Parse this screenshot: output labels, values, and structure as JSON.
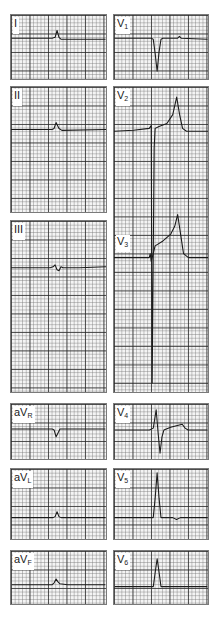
{
  "figure": {
    "type": "12-lead ECG",
    "layout": "two columns of lead panels on grid paper"
  },
  "leads": {
    "I": {
      "name": "I",
      "sub": ""
    },
    "II": {
      "name": "II",
      "sub": ""
    },
    "III": {
      "name": "III",
      "sub": ""
    },
    "aVR": {
      "name": "aV",
      "sub": "R"
    },
    "aVL": {
      "name": "aV",
      "sub": "L"
    },
    "aVF": {
      "name": "aV",
      "sub": "F"
    },
    "V1": {
      "name": "V",
      "sub": "1"
    },
    "V2": {
      "name": "V",
      "sub": "2"
    },
    "V3": {
      "name": "V",
      "sub": "3"
    },
    "V4": {
      "name": "V",
      "sub": "4"
    },
    "V5": {
      "name": "V",
      "sub": "5"
    },
    "V6": {
      "name": "V",
      "sub": "6"
    }
  },
  "colors": {
    "trace": "#1a1a1a",
    "grid_major": "#333333",
    "grid_minor": "#9a9a9a",
    "paper": "#f4f4f4"
  }
}
